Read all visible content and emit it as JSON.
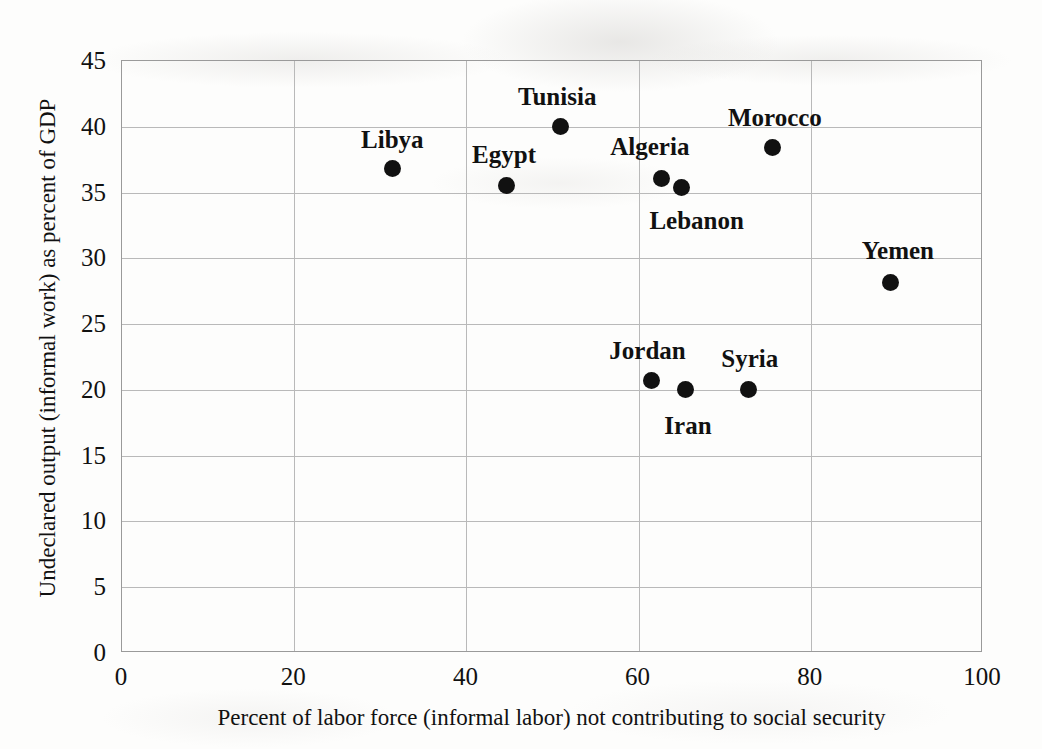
{
  "chart_data": {
    "type": "scatter",
    "title": "",
    "xlabel": "Percent of labor force (informal labor) not contributing to social security",
    "ylabel": "Undeclared output (informal work) as percent of GDP",
    "xlim": [
      0,
      100
    ],
    "ylim": [
      0,
      45
    ],
    "xticks": [
      "0",
      "20",
      "40",
      "60",
      "80",
      "100"
    ],
    "yticks": [
      "0",
      "5",
      "10",
      "15",
      "20",
      "25",
      "30",
      "35",
      "40",
      "45"
    ],
    "grid": true,
    "legend": "none",
    "points": [
      {
        "label": "Libya",
        "x": 31.4,
        "y": 36.8,
        "label_dx": 0,
        "label_dy": -30
      },
      {
        "label": "Egypt",
        "x": 44.6,
        "y": 35.5,
        "label_dx": -2,
        "label_dy": -32
      },
      {
        "label": "Tunisia",
        "x": 50.9,
        "y": 40.0,
        "label_dx": -3,
        "label_dy": -31
      },
      {
        "label": "Algeria",
        "x": 62.7,
        "y": 36.1,
        "label_dx": -12,
        "label_dy": -32
      },
      {
        "label": "Lebanon",
        "x": 65.0,
        "y": 35.4,
        "label_dx": 15,
        "label_dy": 33
      },
      {
        "label": "Morocco",
        "x": 75.6,
        "y": 38.4,
        "label_dx": 2,
        "label_dy": -31
      },
      {
        "label": "Yemen",
        "x": 89.3,
        "y": 28.2,
        "label_dx": 7,
        "label_dy": -32
      },
      {
        "label": "Jordan",
        "x": 61.5,
        "y": 20.7,
        "label_dx": -4,
        "label_dy": -31
      },
      {
        "label": "Iran",
        "x": 65.5,
        "y": 20.0,
        "label_dx": 2,
        "label_dy": 35
      },
      {
        "label": "Syria",
        "x": 72.8,
        "y": 20.0,
        "label_dx": 1,
        "label_dy": -32
      }
    ],
    "marker_color": "#111111"
  }
}
